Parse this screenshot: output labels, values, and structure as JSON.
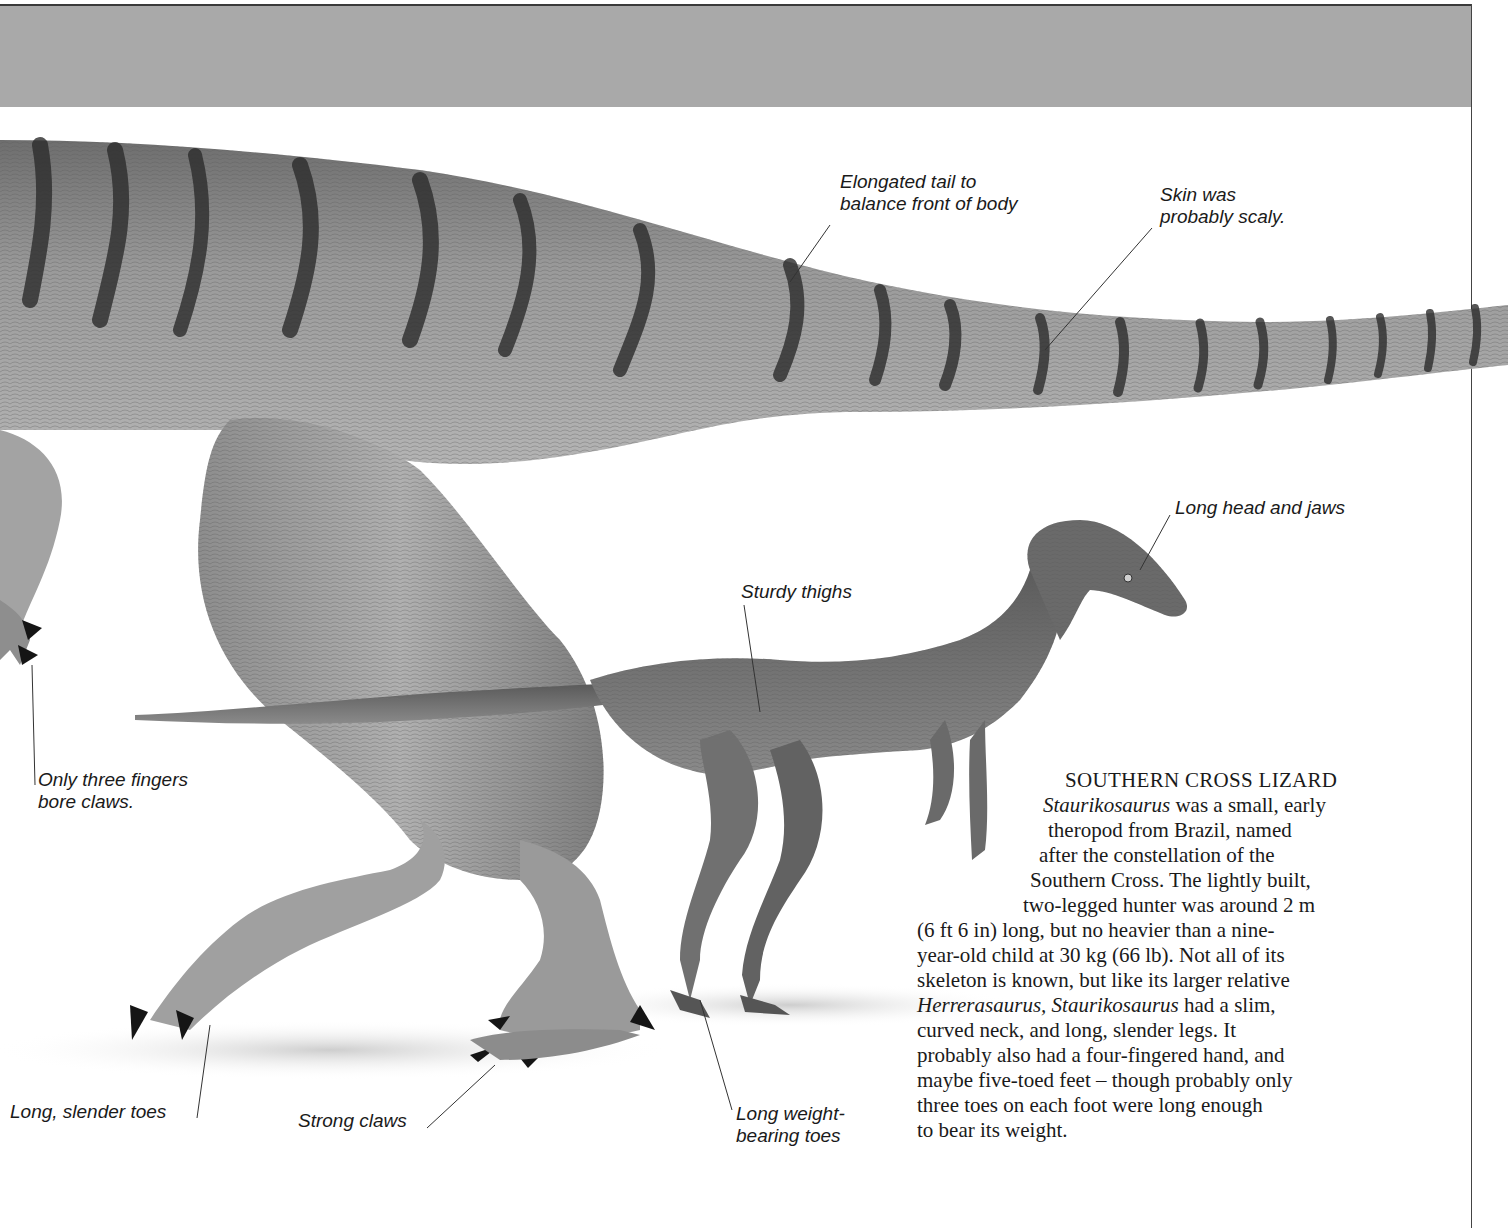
{
  "page": {
    "header_band_color": "#a9a9a9",
    "background_color": "#ffffff"
  },
  "illustrations": {
    "large_dinosaur": {
      "name": "Herrerasaurus",
      "depiction": "partial body: torso, striped tail, arm with claws, legs and feet"
    },
    "small_dinosaur": {
      "name": "Staurikosaurus",
      "depiction": "full body, walking pose"
    }
  },
  "labels": {
    "tail": "Elongated tail to\nbalance front of body",
    "skin": "Skin was\nprobably scaly.",
    "head": "Long head and jaws",
    "thighs": "Sturdy thighs",
    "fingers": "Only three fingers\nbore claws.",
    "toes_slender": "Long, slender toes",
    "claws": "Strong claws",
    "toes_weight": "Long weight-\nbearing toes"
  },
  "article": {
    "title": "SOUTHERN CROSS LIZARD",
    "lines": [
      {
        "italic": "Staurikosaurus",
        "text": " was a small, early"
      },
      {
        "text": "theropod from Brazil, named"
      },
      {
        "text": "after the constellation of the"
      },
      {
        "text": "Southern Cross. The lightly built,"
      },
      {
        "text": "two-legged hunter was around 2 m"
      },
      {
        "text": "(6 ft 6 in) long, but no heavier than a nine-"
      },
      {
        "text": "year-old child at 30 kg (66 lb). Not all of its"
      },
      {
        "text": "skeleton is known, but like its larger relative"
      },
      {
        "italic": "Herrerasaurus, Staurikosaurus",
        "text": " had a slim,"
      },
      {
        "text": "curved neck, and long, slender legs. It"
      },
      {
        "text": "probably also had a four-fingered hand, and"
      },
      {
        "text": "maybe five-toed feet – though probably only"
      },
      {
        "text": "three toes on each foot were long enough"
      },
      {
        "text": "to bear its weight."
      }
    ]
  }
}
